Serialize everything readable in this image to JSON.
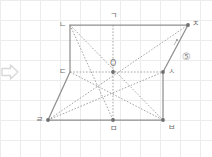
{
  "figure": {
    "kind": "geometry-diagram",
    "background_color": "#ffffff",
    "grid_color": "#ececec",
    "solid_line_color": "#8f8f8f",
    "dashed_line_color": "#9b9b9b",
    "label_color": "#6d6d6d",
    "point_color": "#6f6f6f",
    "grid_spacing": 20,
    "marker": {
      "name": "arrow-right-outline",
      "x": 10,
      "y": 72,
      "color": "#d8d8d8"
    },
    "points": [
      {
        "id": "n",
        "label": "ㄴ",
        "x": 70,
        "y": 25,
        "label_dx": -11,
        "label_dy": -4,
        "dot": false
      },
      {
        "id": "g",
        "label": "ㄱ",
        "x": 113,
        "y": 25,
        "label_dx": -3,
        "label_dy": -13,
        "dot": false
      },
      {
        "id": "j",
        "label": "ㅈ",
        "x": 188,
        "y": 25,
        "label_dx": 4,
        "label_dy": -5,
        "dot": true
      },
      {
        "id": "d",
        "label": "ㄷ",
        "x": 70,
        "y": 72,
        "label_dx": -11,
        "label_dy": -4,
        "dot": false
      },
      {
        "id": "o",
        "label": "O",
        "x": 113,
        "y": 72,
        "label_dx": -3,
        "label_dy": -12,
        "dot": true
      },
      {
        "id": "s",
        "label": "ㅅ",
        "x": 163,
        "y": 72,
        "label_dx": 5,
        "label_dy": -4,
        "dot": true
      },
      {
        "id": "r",
        "label": "ㄹ",
        "x": 48,
        "y": 120,
        "label_dx": -12,
        "label_dy": -4,
        "dot": true
      },
      {
        "id": "m",
        "label": "ㅁ",
        "x": 113,
        "y": 120,
        "label_dx": -3,
        "label_dy": 5,
        "dot": true
      },
      {
        "id": "b",
        "label": "ㅂ",
        "x": 163,
        "y": 120,
        "label_dx": 5,
        "label_dy": 4,
        "dot": true
      }
    ],
    "solid_edges": [
      {
        "name": "edge-n-j",
        "from": "n",
        "to": "j"
      },
      {
        "name": "edge-n-d",
        "from": "n",
        "to": "d"
      },
      {
        "name": "edge-d-r",
        "from": "d",
        "to": "r"
      },
      {
        "name": "edge-r-m",
        "from": "r",
        "to": "m"
      },
      {
        "name": "edge-m-b",
        "from": "m",
        "to": "b"
      },
      {
        "name": "edge-b-s",
        "from": "b",
        "to": "s"
      },
      {
        "name": "edge-s-j",
        "from": "s",
        "to": "j"
      }
    ],
    "dashed_edges": [
      {
        "name": "diag-n-b",
        "from": "n",
        "to": "b"
      },
      {
        "name": "diag-r-j",
        "from": "r",
        "to": "j"
      },
      {
        "name": "median-d-s",
        "from": "d",
        "to": "s"
      },
      {
        "name": "median-g-m",
        "from": "g",
        "to": "m"
      },
      {
        "name": "diag-n-m",
        "from": "n",
        "to": "m"
      },
      {
        "name": "diag-d-b",
        "from": "d",
        "to": "b"
      },
      {
        "name": "diag-r-s",
        "from": "r",
        "to": "s"
      }
    ],
    "callout": {
      "label": "⑤",
      "x": 182,
      "y": 52,
      "leader_from_x": 174,
      "leader_from_y": 45,
      "leader_to_x": 177,
      "leader_to_y": 40
    }
  }
}
